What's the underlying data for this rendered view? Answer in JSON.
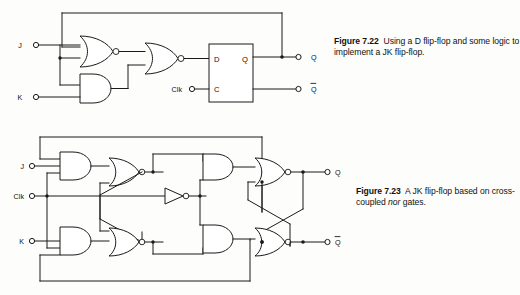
{
  "page": {
    "background_color": "#fdfdfb",
    "ink_color": "#1a1a1a"
  },
  "figures": [
    {
      "id": "figure-7-22",
      "number": "Figure 7.22",
      "caption_line1": "Using a D flip-flop and",
      "caption_line2_pre": "some logic to implement a JK flip-flop.",
      "title": "Using a D flip-flop and some logic to implement a JK flip-flop.",
      "inputs": [
        {
          "label": "J"
        },
        {
          "label": "K"
        },
        {
          "label": "Clk"
        }
      ],
      "outputs": [
        {
          "label": "Q",
          "overbar": false
        },
        {
          "label": "Q",
          "overbar": true
        }
      ],
      "block": {
        "name": "d-flip-flop",
        "pins": [
          {
            "label": "D",
            "side": "left"
          },
          {
            "label": "C",
            "side": "left"
          },
          {
            "label": "Q",
            "side": "right"
          }
        ]
      },
      "gates": [
        {
          "name": "nor-gate-1",
          "type": "nor",
          "inputs": 2
        },
        {
          "name": "and-gate-1",
          "type": "and",
          "inputs": 2
        },
        {
          "name": "nor-gate-2",
          "type": "nor",
          "inputs": 2
        }
      ]
    },
    {
      "id": "figure-7-23",
      "number": "Figure 7.23",
      "caption_line1_pre": "A JK flip-flop based",
      "caption_line2_pre": "on cross-coupled ",
      "caption_line2_italic": "nor",
      "caption_line2_post": " gates.",
      "title": "A JK flip-flop based on cross-coupled nor gates.",
      "inputs": [
        {
          "label": "J"
        },
        {
          "label": "Clk"
        },
        {
          "label": "K"
        }
      ],
      "outputs": [
        {
          "label": "Q",
          "overbar": false
        },
        {
          "label": "Q",
          "overbar": true
        }
      ],
      "gates": [
        {
          "name": "and-gate-j",
          "type": "and",
          "inputs": 3
        },
        {
          "name": "nor-gate-upper-left",
          "type": "nor",
          "inputs": 2
        },
        {
          "name": "inverter-clk",
          "type": "not",
          "inputs": 1
        },
        {
          "name": "and-gate-upper-right",
          "type": "and",
          "inputs": 2
        },
        {
          "name": "nor-gate-q",
          "type": "nor",
          "inputs": 2
        },
        {
          "name": "and-gate-k",
          "type": "and",
          "inputs": 3
        },
        {
          "name": "nor-gate-lower-left",
          "type": "nor",
          "inputs": 2
        },
        {
          "name": "and-gate-lower-right",
          "type": "and",
          "inputs": 2
        },
        {
          "name": "nor-gate-qbar",
          "type": "nor",
          "inputs": 2
        }
      ]
    }
  ]
}
